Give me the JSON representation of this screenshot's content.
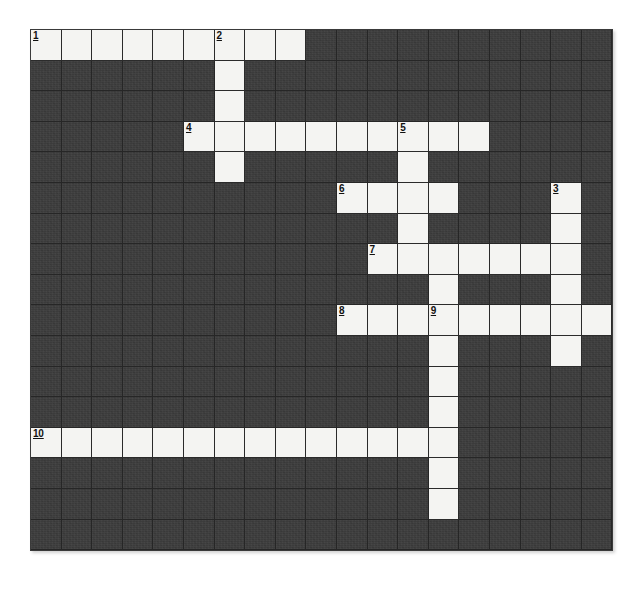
{
  "puzzle": {
    "title": "Crossword Grid",
    "kind": "crossword-grid",
    "columns": 19,
    "rows": 17,
    "cell_size": 30.6,
    "origin_x": 30,
    "origin_y": 29,
    "colors": {
      "blocked_cell": "#3b3b3b",
      "open_cell": "#f4f4f2",
      "grid_line": "#262626",
      "number_text": "#111111",
      "page_background": "#ffffff"
    },
    "open_cells": [
      [
        1,
        1
      ],
      [
        1,
        2
      ],
      [
        1,
        3
      ],
      [
        1,
        4
      ],
      [
        1,
        5
      ],
      [
        1,
        6
      ],
      [
        1,
        7
      ],
      [
        1,
        8
      ],
      [
        1,
        9
      ],
      [
        2,
        7
      ],
      [
        3,
        7
      ],
      [
        4,
        6
      ],
      [
        4,
        7
      ],
      [
        4,
        8
      ],
      [
        4,
        9
      ],
      [
        4,
        10
      ],
      [
        4,
        11
      ],
      [
        4,
        12
      ],
      [
        4,
        13
      ],
      [
        4,
        14
      ],
      [
        4,
        15
      ],
      [
        5,
        7
      ],
      [
        5,
        13
      ],
      [
        6,
        11
      ],
      [
        6,
        12
      ],
      [
        6,
        13
      ],
      [
        6,
        14
      ],
      [
        6,
        18
      ],
      [
        7,
        13
      ],
      [
        7,
        18
      ],
      [
        8,
        12
      ],
      [
        8,
        13
      ],
      [
        8,
        14
      ],
      [
        8,
        15
      ],
      [
        8,
        16
      ],
      [
        8,
        17
      ],
      [
        8,
        18
      ],
      [
        9,
        14
      ],
      [
        9,
        18
      ],
      [
        10,
        11
      ],
      [
        10,
        12
      ],
      [
        10,
        13
      ],
      [
        10,
        14
      ],
      [
        10,
        15
      ],
      [
        10,
        16
      ],
      [
        10,
        17
      ],
      [
        10,
        18
      ],
      [
        10,
        19
      ],
      [
        11,
        14
      ],
      [
        11,
        18
      ],
      [
        12,
        14
      ],
      [
        13,
        14
      ],
      [
        14,
        1
      ],
      [
        14,
        2
      ],
      [
        14,
        3
      ],
      [
        14,
        4
      ],
      [
        14,
        5
      ],
      [
        14,
        6
      ],
      [
        14,
        7
      ],
      [
        14,
        8
      ],
      [
        14,
        9
      ],
      [
        14,
        10
      ],
      [
        14,
        11
      ],
      [
        14,
        12
      ],
      [
        14,
        13
      ],
      [
        14,
        14
      ],
      [
        15,
        14
      ],
      [
        16,
        14
      ]
    ],
    "numbers": [
      {
        "label": "1",
        "row": 1,
        "col": 1
      },
      {
        "label": "2",
        "row": 1,
        "col": 7
      },
      {
        "label": "4",
        "row": 4,
        "col": 6
      },
      {
        "label": "5",
        "row": 4,
        "col": 13
      },
      {
        "label": "6",
        "row": 6,
        "col": 11
      },
      {
        "label": "3",
        "row": 6,
        "col": 18
      },
      {
        "label": "7",
        "row": 8,
        "col": 12
      },
      {
        "label": "8",
        "row": 10,
        "col": 11
      },
      {
        "label": "9",
        "row": 10,
        "col": 14
      },
      {
        "label": "10",
        "row": 14,
        "col": 1
      }
    ],
    "entries": [
      {
        "number": "1",
        "direction": "across",
        "row": 1,
        "col": 1,
        "length": 9
      },
      {
        "number": "2",
        "direction": "down",
        "row": 1,
        "col": 7,
        "length": 5
      },
      {
        "number": "4",
        "direction": "across",
        "row": 4,
        "col": 6,
        "length": 10
      },
      {
        "number": "5",
        "direction": "down",
        "row": 4,
        "col": 13,
        "length": 5
      },
      {
        "number": "6",
        "direction": "across",
        "row": 6,
        "col": 11,
        "length": 4
      },
      {
        "number": "3",
        "direction": "down",
        "row": 6,
        "col": 18,
        "length": 6
      },
      {
        "number": "7",
        "direction": "across",
        "row": 8,
        "col": 12,
        "length": 7
      },
      {
        "number": "8",
        "direction": "across",
        "row": 10,
        "col": 11,
        "length": 9
      },
      {
        "number": "9",
        "direction": "down",
        "row": 10,
        "col": 14,
        "length": 7
      },
      {
        "number": "10",
        "direction": "across",
        "row": 14,
        "col": 1,
        "length": 14
      }
    ],
    "letters": []
  }
}
